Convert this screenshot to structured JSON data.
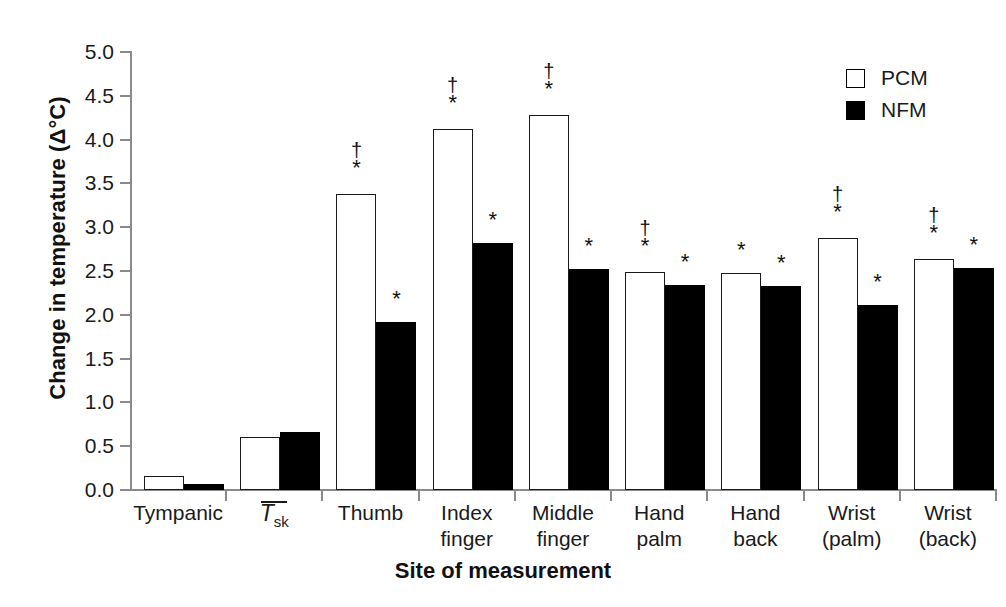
{
  "chart_data": {
    "type": "bar",
    "title": "",
    "xlabel": "Site of measurement",
    "ylabel": "Change in temperature (Δ°C)",
    "ylim": [
      0.0,
      5.0
    ],
    "ytick_labels": [
      "0.0",
      "0.5",
      "1.0",
      "1.5",
      "2.0",
      "2.5",
      "3.0",
      "3.5",
      "4.0",
      "4.5",
      "5.0"
    ],
    "ytick_values": [
      0.0,
      0.5,
      1.0,
      1.5,
      2.0,
      2.5,
      3.0,
      3.5,
      4.0,
      4.5,
      5.0
    ],
    "grid": false,
    "legend_position": "top-right",
    "categories": [
      "Tympanic",
      "Tsk",
      "Thumb",
      "Index finger",
      "Middle finger",
      "Hand palm",
      "Hand back",
      "Wrist (palm)",
      "Wrist (back)"
    ],
    "category_lines": [
      [
        "Tympanic"
      ],
      [
        "Tsk"
      ],
      [
        "Thumb"
      ],
      [
        "Index",
        "finger"
      ],
      [
        "Middle",
        "finger"
      ],
      [
        "Hand",
        "palm"
      ],
      [
        "Hand",
        "back"
      ],
      [
        "Wrist",
        "(palm)"
      ],
      [
        "Wrist",
        "(back)"
      ]
    ],
    "series": [
      {
        "name": "PCM",
        "color": "#ffffff",
        "edge_color": "#1a1a1a",
        "values": [
          0.16,
          0.6,
          3.38,
          4.12,
          4.28,
          2.49,
          2.48,
          2.88,
          2.64
        ],
        "annotations": [
          "",
          "",
          "†\n*",
          "†\n*",
          "†\n*",
          "†\n*",
          "*",
          "†\n*",
          "†\n*"
        ]
      },
      {
        "name": "NFM",
        "color": "#000000",
        "edge_color": "#000000",
        "values": [
          0.07,
          0.66,
          1.92,
          2.82,
          2.52,
          2.34,
          2.33,
          2.11,
          2.54
        ],
        "annotations": [
          "",
          "",
          "*",
          "*",
          "*",
          "*",
          "*",
          "*",
          "*"
        ]
      }
    ],
    "marker_legend": {
      "dagger": "†",
      "asterisk": "*"
    }
  },
  "axis": {
    "y_title_prefix": "Change in temperature (",
    "y_title_delta": "Δ°C",
    "y_title_suffix": ")",
    "x_title": "Site of measurement"
  },
  "legend": {
    "items": [
      {
        "label": "PCM",
        "swatch": "open-square"
      },
      {
        "label": "NFM",
        "swatch": "filled-square"
      }
    ]
  }
}
